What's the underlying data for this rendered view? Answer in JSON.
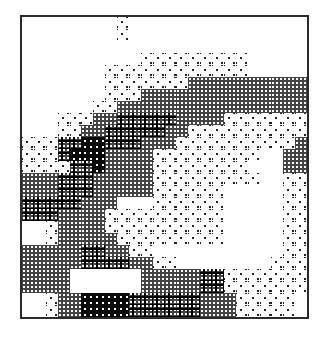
{
  "figure": {
    "type": "dithered-raster-map",
    "levels": {
      "0": "white",
      "1": "light-dots",
      "2": "medium-checker",
      "3": "dark-checker-crosses",
      "4": "black"
    },
    "columns": 24,
    "rows": 25,
    "grid": [
      "000000001000000000000000",
      "000000001000000000000000",
      "000000000000000000000000",
      "000000000011111111100000",
      "000000011111111111100000",
      "000000011111112222222222",
      "000000011122222222222222",
      "000000112222222222222222",
      "000111223333322221111111",
      "000112233333221111111111",
      "111334433322211111111112",
      "111344422221111111110022",
      "111133422221111111100022",
      "222333222221111111110011",
      "222333222221111110000011",
      "333332220001111110000011",
      "333222211111111110000011",
      "001222211111111110000011",
      "001222221111111110000011",
      "222223322110000000000011",
      "222223333221100000000111",
      "222200000022222331111111",
      "222200000022222331111111",
      "001224444333333222111110",
      "001224444333333222111110"
    ]
  }
}
